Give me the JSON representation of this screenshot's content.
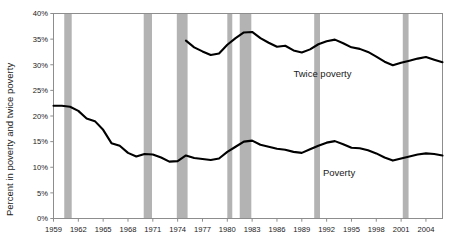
{
  "chart_data": {
    "type": "line",
    "title": "",
    "xlabel": "",
    "ylabel": "Percent in poverty and twice poverty",
    "xlim": [
      1959,
      2006
    ],
    "ylim": [
      0,
      40
    ],
    "ytick_labels": [
      "40%",
      "35%",
      "30%",
      "25%",
      "20%",
      "15%",
      "10%",
      "5%",
      "0%"
    ],
    "ytick_values": [
      40,
      35,
      30,
      25,
      20,
      15,
      10,
      5,
      0
    ],
    "xtick_labels": [
      "1959",
      "1962",
      "1965",
      "1968",
      "1971",
      "1974",
      "1977",
      "1980",
      "1983",
      "1986",
      "1989",
      "1992",
      "1995",
      "1998",
      "2001",
      "2004"
    ],
    "xtick_values": [
      1959,
      1962,
      1965,
      1968,
      1971,
      1974,
      1977,
      1980,
      1983,
      1986,
      1989,
      1992,
      1995,
      1998,
      2001,
      2004
    ],
    "grid": false,
    "legend_position": "inline-annotation",
    "series": [
      {
        "name": "Twice poverty",
        "label_x": 1991.5,
        "label_y": 27.6,
        "color": "#000000",
        "x": [
          1975,
          1976,
          1977,
          1978,
          1979,
          1980,
          1981,
          1982,
          1983,
          1984,
          1985,
          1986,
          1987,
          1988,
          1989,
          1990,
          1991,
          1992,
          1993,
          1994,
          1995,
          1996,
          1997,
          1998,
          1999,
          2000,
          2001,
          2002,
          2003,
          2004,
          2005,
          2006
        ],
        "values": [
          34.7,
          33.4,
          32.6,
          31.9,
          32.2,
          33.9,
          35.2,
          36.3,
          36.4,
          35.2,
          34.3,
          33.5,
          33.7,
          32.8,
          32.4,
          33.0,
          34.0,
          34.6,
          34.9,
          34.2,
          33.4,
          33.1,
          32.5,
          31.6,
          30.6,
          29.9,
          30.4,
          30.8,
          31.2,
          31.5,
          31.0,
          30.5
        ]
      },
      {
        "name": "Poverty",
        "label_x": 1993.5,
        "label_y": 8.3,
        "color": "#000000",
        "x": [
          1959,
          1960,
          1961,
          1962,
          1963,
          1964,
          1965,
          1966,
          1967,
          1968,
          1969,
          1970,
          1971,
          1972,
          1973,
          1974,
          1975,
          1976,
          1977,
          1978,
          1979,
          1980,
          1981,
          1982,
          1983,
          1984,
          1985,
          1986,
          1987,
          1988,
          1989,
          1990,
          1991,
          1992,
          1993,
          1994,
          1995,
          1996,
          1997,
          1998,
          1999,
          2000,
          2001,
          2002,
          2003,
          2004,
          2005,
          2006
        ],
        "values": [
          22.0,
          22.0,
          21.8,
          21.0,
          19.5,
          19.0,
          17.3,
          14.7,
          14.2,
          12.8,
          12.1,
          12.6,
          12.5,
          11.9,
          11.1,
          11.2,
          12.3,
          11.8,
          11.6,
          11.4,
          11.7,
          13.0,
          14.0,
          15.0,
          15.2,
          14.4,
          14.0,
          13.6,
          13.4,
          13.0,
          12.8,
          13.5,
          14.2,
          14.8,
          15.1,
          14.5,
          13.8,
          13.7,
          13.3,
          12.7,
          11.9,
          11.3,
          11.7,
          12.1,
          12.5,
          12.7,
          12.6,
          12.3
        ]
      }
    ],
    "recession_bands": [
      {
        "name": "recession-1960",
        "start": 1960.3,
        "end": 1961.2
      },
      {
        "name": "recession-1969",
        "start": 1969.9,
        "end": 1970.9
      },
      {
        "name": "recession-1973",
        "start": 1973.9,
        "end": 1975.2
      },
      {
        "name": "recession-1980",
        "start": 1980.0,
        "end": 1980.6
      },
      {
        "name": "recession-1981",
        "start": 1981.5,
        "end": 1982.9
      },
      {
        "name": "recession-1990",
        "start": 1990.5,
        "end": 1991.2
      },
      {
        "name": "recession-2001",
        "start": 2001.2,
        "end": 2001.9
      }
    ],
    "band_color": "#b3b3b3",
    "line_color": "#000000",
    "frame_color": "#8d8d8d",
    "background_color": "#ffffff"
  }
}
